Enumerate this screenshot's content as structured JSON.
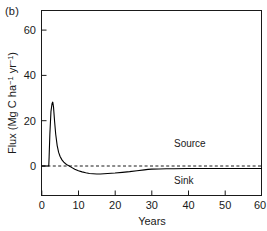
{
  "panel": {
    "label": "(b)"
  },
  "chart_data": {
    "type": "line",
    "title": "",
    "xlabel": "Years",
    "ylabel": "Flux (Mg C ha−1 yr−1)",
    "ylabel_parts": {
      "prefix": "Flux (Mg C ha",
      "sup1": "−1",
      "mid": " yr",
      "sup2": "−1",
      "suffix": ")"
    },
    "xlim": [
      0,
      60
    ],
    "ylim": [
      -10,
      68
    ],
    "xticks": [
      0,
      10,
      20,
      30,
      40,
      50,
      60
    ],
    "xticklabels": [
      "0",
      "10",
      "20",
      "30",
      "40",
      "50",
      "60"
    ],
    "yticks": [
      0,
      20,
      40,
      60
    ],
    "yticklabels": [
      "0",
      "20",
      "40",
      "60"
    ],
    "grid": false,
    "legend": "none",
    "annotations": [
      {
        "text": "Source",
        "x": 36,
        "y": 9
      },
      {
        "text": "Sink",
        "x": 38,
        "y": -6
      }
    ],
    "reference_line": {
      "y": 0,
      "style": "dashed",
      "label": "zero-flux"
    },
    "series": [
      {
        "name": "Net carbon flux",
        "style": "solid",
        "color": "#000000",
        "x": [
          0,
          1.0,
          1.9,
          2.0,
          2.2,
          2.5,
          2.8,
          3.0,
          3.2,
          3.5,
          3.8,
          4.2,
          4.6,
          5.0,
          5.5,
          6.0,
          6.5,
          7.0,
          7.5,
          8.0,
          9.0,
          10.0,
          11.0,
          12.0,
          13.0,
          14.0,
          15.0,
          16.0,
          17.0,
          18.0,
          19.0,
          20.0,
          22.0,
          24.0,
          26.0,
          28.0,
          29.0,
          30.0,
          32.0,
          34.0,
          36.0,
          40.0,
          45.0,
          50.0,
          55.0,
          60.0
        ],
        "y": [
          0,
          0,
          0,
          4.0,
          14.0,
          24.0,
          27.6,
          28.2,
          26.0,
          19.5,
          14.0,
          9.0,
          6.0,
          4.2,
          2.7,
          1.7,
          1.0,
          0.4,
          0.0,
          -0.5,
          -1.4,
          -2.1,
          -2.6,
          -3.0,
          -3.3,
          -3.4,
          -3.5,
          -3.5,
          -3.4,
          -3.3,
          -3.2,
          -3.1,
          -2.8,
          -2.5,
          -2.1,
          -1.7,
          -1.5,
          -1.4,
          -1.3,
          -1.2,
          -1.2,
          -1.1,
          -1.1,
          -1.1,
          -1.1,
          -1.1
        ]
      }
    ],
    "peak": {
      "x": 3.0,
      "y": 28
    },
    "trough": {
      "x": 15.5,
      "y": -3.5
    }
  }
}
